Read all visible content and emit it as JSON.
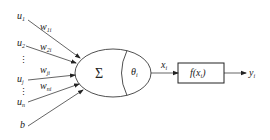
{
  "diagram": {
    "type": "artificial-neuron-model",
    "inputs": [
      {
        "name": "u",
        "sub": "1"
      },
      {
        "name": "u",
        "sub": "2"
      },
      {
        "name": "u",
        "sub": "j"
      },
      {
        "name": "u",
        "sub": "n"
      },
      {
        "name": "b",
        "sub": ""
      }
    ],
    "weights": [
      {
        "name": "w",
        "sub": "1i"
      },
      {
        "name": "w",
        "sub": "2i"
      },
      {
        "name": "w",
        "sub": "ji"
      },
      {
        "name": "w",
        "sub": "ni"
      }
    ],
    "ellipsis": "⋮",
    "summation_symbol": "Σ",
    "threshold": {
      "name": "θ",
      "sub": "i"
    },
    "net_input": {
      "name": "x",
      "sub": "i"
    },
    "activation": {
      "label": "f(x",
      "sub": "i",
      "close": ")"
    },
    "output": {
      "name": "y",
      "sub": "i"
    },
    "colors": {
      "stroke": "#222222",
      "background": "#ffffff"
    }
  }
}
